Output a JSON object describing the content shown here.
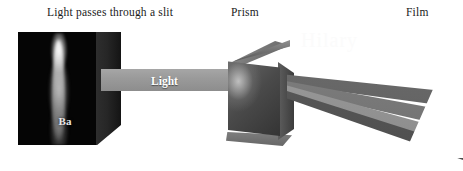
{
  "diagram": {
    "labels": {
      "slit": "Light passes through a slit",
      "prism": "Prism",
      "film": "Film"
    },
    "beam": {
      "incident_label": "Light"
    },
    "flame": {
      "element_symbol": "Ba"
    },
    "watermark": "Hilary",
    "colors": {
      "background": "#ffffff",
      "panel_face": "#050505",
      "panel_side": "#262626",
      "beam_incident": "#9a9a9a",
      "prism_face": "#4a4a4a",
      "prism_top": "#7c7c7c",
      "ray_upper": "#6b6b6b",
      "ray_middle": "#7f7f7f",
      "ray_lower": "#9b9b9b",
      "ray_bottom": "#5a5a5a",
      "label_text": "#1a1a1a",
      "beam_text": "#ffffff",
      "flame_text": "#e8e8e8"
    }
  }
}
